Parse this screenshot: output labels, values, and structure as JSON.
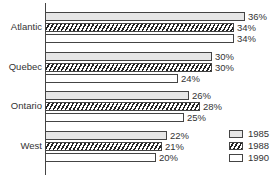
{
  "chart_data": {
    "type": "bar",
    "orientation": "horizontal",
    "title": "",
    "xlabel": "",
    "ylabel": "",
    "categories": [
      "Atlantic",
      "Quebec",
      "Ontario",
      "West"
    ],
    "series": [
      {
        "name": "1985",
        "pattern": "dotted",
        "values": [
          36,
          30,
          26,
          22
        ]
      },
      {
        "name": "1988",
        "pattern": "hatched",
        "values": [
          34,
          30,
          28,
          21
        ]
      },
      {
        "name": "1990",
        "pattern": "blank",
        "values": [
          34,
          24,
          25,
          20
        ]
      }
    ],
    "value_labels": [
      [
        "36%",
        "34%",
        "34%"
      ],
      [
        "30%",
        "30%",
        "24%"
      ],
      [
        "26%",
        "28%",
        "25%"
      ],
      [
        "22%",
        "21%",
        "20%"
      ]
    ],
    "xlim": [
      0,
      40
    ],
    "grid": false,
    "legend_position": "bottom-right",
    "legend": [
      "1985",
      "1988",
      "1990"
    ]
  }
}
